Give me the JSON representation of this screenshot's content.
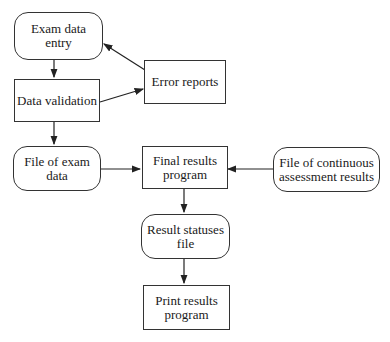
{
  "diagram": {
    "type": "flowchart",
    "nodes": [
      {
        "id": "exam_entry",
        "label": "Exam data\nentry",
        "shape": "rounded"
      },
      {
        "id": "validation",
        "label": "Data validation",
        "shape": "rect"
      },
      {
        "id": "error_reports",
        "label": "Error reports",
        "shape": "rect"
      },
      {
        "id": "exam_file",
        "label": "File of exam\ndata",
        "shape": "rounded"
      },
      {
        "id": "final_results",
        "label": "Final results\nprogram",
        "shape": "rect"
      },
      {
        "id": "ca_file",
        "label": "File of continuous\nassessment results",
        "shape": "rounded"
      },
      {
        "id": "statuses_file",
        "label": "Result statuses\nfile",
        "shape": "rounded"
      },
      {
        "id": "print_results",
        "label": "Print results\nprogram",
        "shape": "rect"
      }
    ],
    "edges": [
      {
        "from": "exam_entry",
        "to": "validation"
      },
      {
        "from": "validation",
        "to": "error_reports"
      },
      {
        "from": "error_reports",
        "to": "exam_entry"
      },
      {
        "from": "validation",
        "to": "exam_file"
      },
      {
        "from": "exam_file",
        "to": "final_results"
      },
      {
        "from": "ca_file",
        "to": "final_results"
      },
      {
        "from": "final_results",
        "to": "statuses_file"
      },
      {
        "from": "statuses_file",
        "to": "print_results"
      }
    ]
  }
}
